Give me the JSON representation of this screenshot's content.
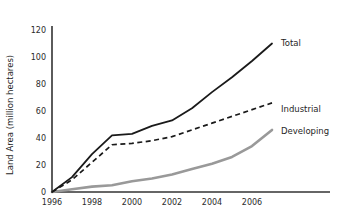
{
  "chart_data": {
    "type": "line",
    "title": "",
    "xlabel": "",
    "ylabel": "Land Area (million hectares)",
    "xlim": [
      1996,
      2007
    ],
    "ylim": [
      0,
      120
    ],
    "xticks": [
      "1996",
      "1998",
      "2000",
      "2002",
      "2004",
      "2006"
    ],
    "xtick_values": [
      1996,
      1998,
      2000,
      2002,
      2004,
      2006
    ],
    "yticks": [
      "0",
      "20",
      "40",
      "60",
      "80",
      "100",
      "120"
    ],
    "ytick_values": [
      0,
      20,
      40,
      60,
      80,
      100,
      120
    ],
    "grid": false,
    "legend_position": "right-inline",
    "x": [
      1996,
      1997,
      1998,
      1999,
      2000,
      2001,
      2002,
      2003,
      2004,
      2005,
      2006,
      2007
    ],
    "series": [
      {
        "name": "Total",
        "style": "solid",
        "color": "#1a1a1a",
        "values": [
          0,
          11,
          28,
          42,
          43,
          49,
          53,
          62,
          74,
          85,
          97,
          110
        ]
      },
      {
        "name": "Industrial",
        "style": "dashed",
        "color": "#1a1a1a",
        "values": [
          0,
          9,
          22,
          35,
          36,
          38,
          41,
          46,
          51,
          56,
          61,
          66
        ]
      },
      {
        "name": "Developing",
        "style": "solid",
        "color": "#999999",
        "values": [
          0,
          2,
          4,
          5,
          8,
          10,
          13,
          17,
          21,
          26,
          34,
          46
        ]
      }
    ]
  },
  "labels": {
    "y_axis_title": "Land Area (million hectares)",
    "series_total": "Total",
    "series_industrial": "Industrial",
    "series_developing": "Developing",
    "ytick_0": "0",
    "ytick_20": "20",
    "ytick_40": "40",
    "ytick_60": "60",
    "ytick_80": "80",
    "ytick_100": "100",
    "ytick_120": "120",
    "xtick_1996": "1996",
    "xtick_1998": "1998",
    "xtick_2000": "2000",
    "xtick_2002": "2002",
    "xtick_2004": "2004",
    "xtick_2006": "2006"
  },
  "colors": {
    "total": "#1a1a1a",
    "industrial": "#1a1a1a",
    "developing": "#999999",
    "axis": "#333333",
    "background": "#ffffff"
  }
}
